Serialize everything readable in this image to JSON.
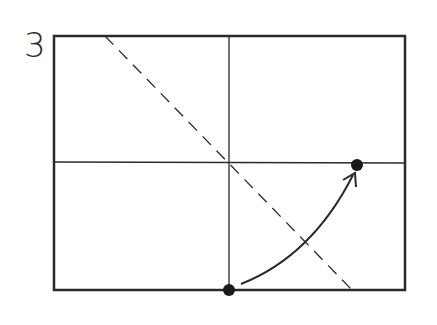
{
  "step": {
    "number": "3"
  },
  "diagram": {
    "frame": {
      "x1": 54,
      "y1": 36,
      "x2": 405,
      "y2": 290,
      "stroke": "#2a2a2a"
    },
    "crease_vertical": {
      "x": 229,
      "y1": 36,
      "y2": 290
    },
    "crease_horizontal": {
      "y": 162,
      "x1": 54,
      "x2": 405
    },
    "fold_line_dashed": {
      "x1": 105,
      "y1": 36,
      "x2": 352,
      "y2": 290
    },
    "point_start": {
      "cx": 229,
      "cy": 290
    },
    "point_end": {
      "cx": 357,
      "cy": 165
    },
    "arrow": {
      "from": [
        241,
        284
      ],
      "ctrl": [
        312,
        256
      ],
      "to": [
        353,
        175
      ]
    },
    "colors": {
      "ink": "#2a2a2a",
      "background": "#ffffff"
    }
  }
}
